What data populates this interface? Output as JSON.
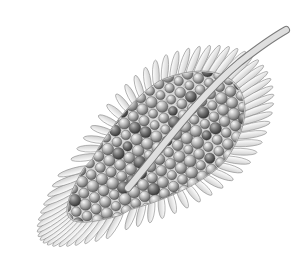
{
  "image": {
    "description": "Grayscale illustration of a leaf-shaped seed head covered in spheres with a petal fringe and a curved stem",
    "width": 306,
    "height": 267,
    "background": "#ffffff"
  },
  "leaf": {
    "center": [
      158,
      148
    ],
    "rotation_deg": -38,
    "rx": 112,
    "ry": 64,
    "fringe_count": 64,
    "fringe_color": "#f2f2f2",
    "fringe_stroke": "#8a8a8a",
    "body_color": "#d8d8d8",
    "sphere_light": "#e6e6e6",
    "sphere_mid": "#9a9a9a",
    "sphere_dark": "#555555",
    "bead_color": "#f4f4f4"
  },
  "stem": {
    "path": "M 128 188 C 160 150, 200 95, 240 62 C 258 48, 272 38, 286 30",
    "color": "#efefef",
    "stroke": "#7a7a7a",
    "width": 8
  }
}
